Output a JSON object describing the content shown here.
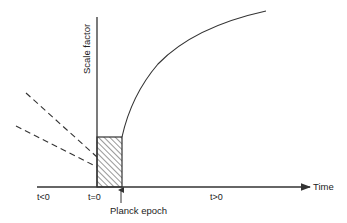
{
  "diagram": {
    "type": "cosmology-scale-factor-vs-time",
    "y_axis_label": "Scale factor",
    "x_axis_label": "Time",
    "regions": {
      "before": "t<0",
      "origin": "t=0",
      "after": "t>0"
    },
    "annotation": "Planck epoch",
    "colors": {
      "line": "#333333",
      "text": "#222222",
      "background": "#ffffff"
    }
  }
}
